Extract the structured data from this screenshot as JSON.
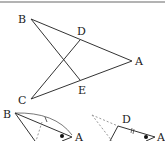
{
  "figure": {
    "top_rule_color": "#9a9a9a",
    "stroke_color": "#333333",
    "dash_color": "#999999",
    "main": {
      "labels": {
        "B": "B",
        "D": "D",
        "A": "A",
        "C": "C",
        "E": "E"
      },
      "points": {
        "B": [
          31,
          19
        ],
        "A": [
          132,
          61
        ],
        "D": [
          80,
          40
        ],
        "E": [
          80,
          80
        ],
        "C": [
          31,
          99
        ]
      },
      "segments": [
        [
          "B",
          "A"
        ],
        [
          "C",
          "A"
        ],
        [
          "B",
          "E"
        ],
        [
          "C",
          "D"
        ]
      ]
    },
    "sub_left": {
      "labels": {
        "B": "B",
        "A": "A"
      },
      "marks": {
        "tick": "single",
        "angle_dot": true,
        "arc": true,
        "dashed_line": true
      }
    },
    "sub_right": {
      "labels": {
        "D": "D",
        "A": "A"
      },
      "marks": {
        "tick": "double",
        "angle_dot": true,
        "dashed_lines": 2
      }
    }
  }
}
